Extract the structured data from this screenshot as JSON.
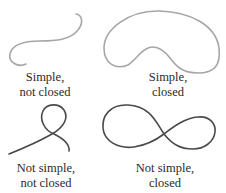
{
  "figure": {
    "panels": [
      {
        "id": "simple-not-closed",
        "caption_line1": "Simple,",
        "caption_line2": "not closed",
        "stroke": "#a6a6a6"
      },
      {
        "id": "simple-closed",
        "caption_line1": "Simple,",
        "caption_line2": "closed",
        "stroke": "#a6a6a6"
      },
      {
        "id": "not-simple-not-closed",
        "caption_line1": "Not simple,",
        "caption_line2": "not closed",
        "stroke": "#4a4a4a"
      },
      {
        "id": "not-simple-closed",
        "caption_line1": "Not simple,",
        "caption_line2": "closed",
        "stroke": "#4a4a4a"
      }
    ]
  }
}
